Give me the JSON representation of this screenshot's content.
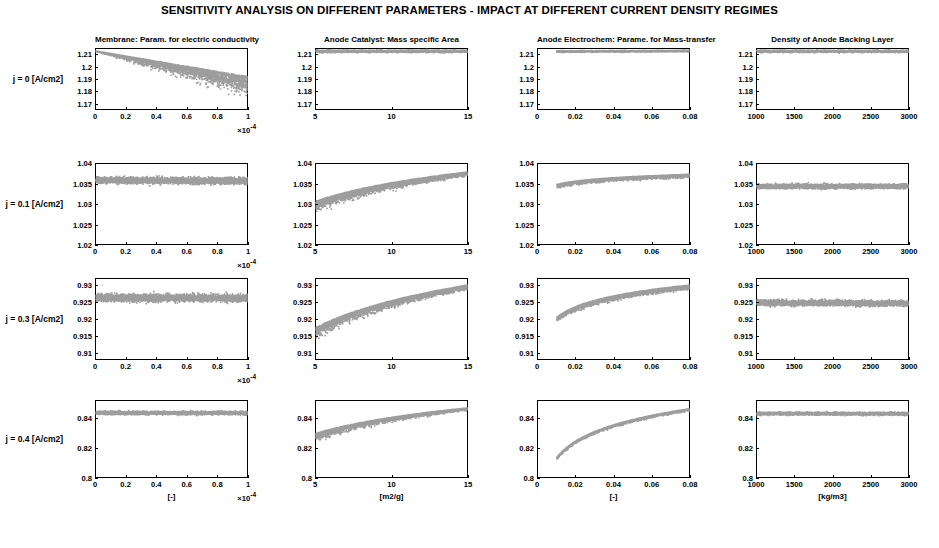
{
  "figure": {
    "title": "SENSITIVITY ANALYSIS ON DIFFERENT PARAMETERS - IMPACT AT DIFFERENT CURRENT DENSITY REGIMES",
    "marker_color": "#8c8c8c",
    "axis_color": "#000000",
    "background": "#ffffff"
  },
  "rows": [
    {
      "label": "j = 0 [A/cm2]",
      "ylim": [
        1.165,
        1.215
      ],
      "yticks": [
        "1.17",
        "1.18",
        "1.19",
        "1.2",
        "1.21"
      ],
      "ytickvals": [
        1.17,
        1.18,
        1.19,
        1.2,
        1.21
      ]
    },
    {
      "label": "j = 0.1 [A/cm2]",
      "ylim": [
        1.02,
        1.04
      ],
      "yticks": [
        "1.02",
        "1.025",
        "1.03",
        "1.035",
        "1.04"
      ],
      "ytickvals": [
        1.02,
        1.025,
        1.03,
        1.035,
        1.04
      ]
    },
    {
      "label": "j = 0.3 [A/cm2]",
      "ylim": [
        0.908,
        0.932
      ],
      "yticks": [
        "0.91",
        "0.915",
        "0.92",
        "0.925",
        "0.93"
      ],
      "ytickvals": [
        0.91,
        0.915,
        0.92,
        0.925,
        0.93
      ]
    },
    {
      "label": "j = 0.4 [A/cm2]",
      "ylim": [
        0.8,
        0.852
      ],
      "yticks": [
        "0.8",
        "0.82",
        "0.84"
      ],
      "ytickvals": [
        0.8,
        0.82,
        0.84
      ]
    }
  ],
  "columns": [
    {
      "title": "Membrane: Param. for electric conductivity",
      "xlabel": "[-]",
      "xmultiplier": "×10",
      "xmultiplier_exp": "-4",
      "xlim": [
        0,
        1
      ],
      "xticks": [
        "0",
        "0.2",
        "0.4",
        "0.6",
        "0.8",
        "1"
      ],
      "xtickvals": [
        0,
        0.2,
        0.4,
        0.6,
        0.8,
        1
      ]
    },
    {
      "title": "Anode Catalyst: Mass specific Area",
      "xlabel": "[m2/g]",
      "xmultiplier": "",
      "xmultiplier_exp": "",
      "xlim": [
        5,
        15
      ],
      "xticks": [
        "5",
        "10",
        "15"
      ],
      "xtickvals": [
        5,
        10,
        15
      ]
    },
    {
      "title": "Anode Electrochem: Parame. for Mass-transfer",
      "xlabel": "[-]",
      "xmultiplier": "",
      "xmultiplier_exp": "",
      "xlim": [
        0,
        0.08
      ],
      "xticks": [
        "0",
        "0.02",
        "0.04",
        "0.06",
        "0.08"
      ],
      "xtickvals": [
        0,
        0.02,
        0.04,
        0.06,
        0.08
      ]
    },
    {
      "title": "Density of Anode Backing Layer",
      "xlabel": "[kg/m3]",
      "xmultiplier": "",
      "xmultiplier_exp": "",
      "xlim": [
        1000,
        3000
      ],
      "xticks": [
        "1000",
        "1500",
        "2000",
        "2500",
        "3000"
      ],
      "xtickvals": [
        1000,
        1500,
        2000,
        2500,
        3000
      ]
    }
  ],
  "chart_data": {
    "type": "scatter",
    "title": "SENSITIVITY ANALYSIS ON DIFFERENT PARAMETERS - IMPACT AT DIFFERENT CURRENT DENSITY REGIMES",
    "grid": false,
    "legend": "none",
    "ylabel": "Cell voltage [V]",
    "layout": {
      "rows": 4,
      "cols": 4
    },
    "panels": [
      {
        "row": 0,
        "col": 0,
        "trend": "decreasing-fan",
        "x_start": 0,
        "x_end": 1,
        "y_start": 1.213,
        "y_end": 1.185,
        "spread_start": 0.001,
        "spread_end": 0.03,
        "n": 2600
      },
      {
        "row": 0,
        "col": 1,
        "trend": "flat",
        "x_start": 5,
        "x_end": 15,
        "y_start": 1.213,
        "y_end": 1.213,
        "spread_start": 0.0035,
        "spread_end": 0.0035,
        "n": 2600
      },
      {
        "row": 0,
        "col": 2,
        "trend": "flat",
        "x_start": 0.01,
        "x_end": 0.08,
        "y_start": 1.2128,
        "y_end": 1.2132,
        "spread_start": 0.0022,
        "spread_end": 0.0022,
        "n": 2600
      },
      {
        "row": 0,
        "col": 3,
        "trend": "flat",
        "x_start": 1000,
        "x_end": 3000,
        "y_start": 1.213,
        "y_end": 1.213,
        "spread_start": 0.0032,
        "spread_end": 0.0032,
        "n": 2600
      },
      {
        "row": 1,
        "col": 0,
        "trend": "flat",
        "x_start": 0,
        "x_end": 1,
        "y_start": 1.036,
        "y_end": 1.0358,
        "spread_start": 0.0028,
        "spread_end": 0.0028,
        "n": 3000
      },
      {
        "row": 1,
        "col": 1,
        "trend": "log-rise",
        "x_start": 5,
        "x_end": 15,
        "y_start": 1.0295,
        "y_end": 1.0375,
        "spread_start": 0.0055,
        "spread_end": 0.0022,
        "n": 3000
      },
      {
        "row": 1,
        "col": 2,
        "trend": "log-rise",
        "x_start": 0.01,
        "x_end": 0.08,
        "y_start": 1.0345,
        "y_end": 1.037,
        "spread_start": 0.0018,
        "spread_end": 0.0018,
        "n": 3000
      },
      {
        "row": 1,
        "col": 3,
        "trend": "flat",
        "x_start": 1000,
        "x_end": 3000,
        "y_start": 1.0345,
        "y_end": 1.0345,
        "spread_start": 0.002,
        "spread_end": 0.002,
        "n": 3000
      },
      {
        "row": 2,
        "col": 0,
        "trend": "flat",
        "x_start": 0,
        "x_end": 1,
        "y_start": 0.9265,
        "y_end": 0.9263,
        "spread_start": 0.004,
        "spread_end": 0.004,
        "n": 3000
      },
      {
        "row": 2,
        "col": 1,
        "trend": "log-rise",
        "x_start": 5,
        "x_end": 15,
        "y_start": 0.916,
        "y_end": 0.9295,
        "spread_start": 0.007,
        "spread_end": 0.003,
        "n": 3000
      },
      {
        "row": 2,
        "col": 2,
        "trend": "log-rise",
        "x_start": 0.01,
        "x_end": 0.08,
        "y_start": 0.92,
        "y_end": 0.9295,
        "spread_start": 0.0028,
        "spread_end": 0.0028,
        "n": 3000
      },
      {
        "row": 2,
        "col": 3,
        "trend": "flat",
        "x_start": 1000,
        "x_end": 3000,
        "y_start": 0.925,
        "y_end": 0.9248,
        "spread_start": 0.003,
        "spread_end": 0.003,
        "n": 3000
      },
      {
        "row": 3,
        "col": 0,
        "trend": "flat",
        "x_start": 0,
        "x_end": 1,
        "y_start": 0.844,
        "y_end": 0.8438,
        "spread_start": 0.004,
        "spread_end": 0.004,
        "n": 3000
      },
      {
        "row": 3,
        "col": 1,
        "trend": "log-rise",
        "x_start": 5,
        "x_end": 15,
        "y_start": 0.8275,
        "y_end": 0.8465,
        "spread_start": 0.011,
        "spread_end": 0.0035,
        "n": 3000
      },
      {
        "row": 3,
        "col": 2,
        "trend": "log-rise",
        "x_start": 0.01,
        "x_end": 0.08,
        "y_start": 0.8135,
        "y_end": 0.846,
        "spread_start": 0.0035,
        "spread_end": 0.0035,
        "n": 3000
      },
      {
        "row": 3,
        "col": 3,
        "trend": "flat",
        "x_start": 1000,
        "x_end": 3000,
        "y_start": 0.8435,
        "y_end": 0.8433,
        "spread_start": 0.0035,
        "spread_end": 0.0035,
        "n": 3000
      }
    ]
  }
}
